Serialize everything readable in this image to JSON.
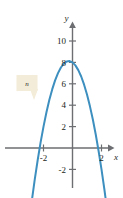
{
  "figure": {
    "background": "#ffffff",
    "curve_color": "#3d8fbf",
    "axis_color": "#6d6e71",
    "text_color": "#231f20",
    "callout_fill": "#f3ecd8",
    "callout_label": "n",
    "callout_name": "curve-callout"
  },
  "chart_data": {
    "type": "line",
    "title": "",
    "xlabel": "x",
    "ylabel": "y",
    "grid": false,
    "legend": null,
    "xlim": [
      -3.3,
      3.0
    ],
    "ylim": [
      -3.6,
      11.2
    ],
    "xticks": [
      -2,
      2
    ],
    "xtick_labels": [
      "-2",
      "2"
    ],
    "yticks": [
      -2,
      2,
      4,
      6,
      8,
      10
    ],
    "ytick_labels": [
      "-2",
      "2",
      "4",
      "6",
      "8",
      "10"
    ],
    "annotations": [
      {
        "text": "n",
        "target": "parabola-curve",
        "style": "callout-box"
      }
    ],
    "series": [
      {
        "name": "n",
        "type": "parabola",
        "equation": "y = -2x^2 - x + 8",
        "vertex": [
          -0.25,
          9.125
        ],
        "y_intercept": 8,
        "x_intercepts": [
          -2.27,
          1.77
        ],
        "x": [
          -3.2,
          -3.0,
          -2.8,
          -2.6,
          -2.4,
          -2.2,
          -2.0,
          -1.8,
          -1.6,
          -1.4,
          -1.2,
          -1.0,
          -0.8,
          -0.6,
          -0.4,
          -0.2,
          0.0,
          0.2,
          0.4,
          0.6,
          0.8,
          1.0,
          1.2,
          1.4,
          1.6,
          1.8,
          2.0,
          2.2,
          2.4,
          2.6,
          2.8
        ],
        "y": [
          -9.28,
          -7.0,
          -4.88,
          -2.92,
          -1.12,
          0.52,
          2.0,
          3.32,
          4.48,
          5.48,
          6.32,
          7.0,
          7.52,
          7.88,
          8.08,
          8.12,
          8.0,
          7.72,
          7.28,
          6.68,
          5.92,
          5.0,
          3.92,
          2.68,
          1.28,
          -0.28,
          -2.0,
          -3.88,
          -5.92,
          -8.12,
          -10.48
        ]
      }
    ]
  },
  "labels": {
    "x_axis": "x",
    "y_axis": "y",
    "y10": "10",
    "y8": "8",
    "y6": "6",
    "y4": "4",
    "y2": "2",
    "yneg2": "-2",
    "xneg2": "-2",
    "x2": "2"
  }
}
